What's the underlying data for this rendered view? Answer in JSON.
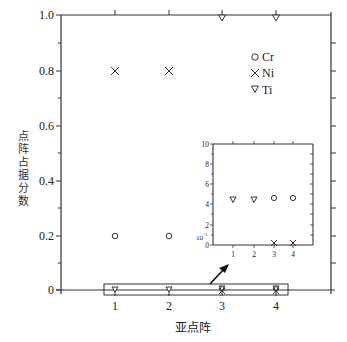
{
  "chart_data": [
    {
      "type": "scatter",
      "title": "",
      "xlabel": "亚点阵",
      "ylabel": "点阵占据分数",
      "x": [
        1,
        2,
        3,
        4
      ],
      "x_ticks": [
        "1",
        "2",
        "3",
        "4"
      ],
      "y_ticks": [
        "0",
        "0.2",
        "0.4",
        "0.6",
        "0.8",
        "1.0"
      ],
      "ylim": [
        0,
        1.0
      ],
      "grid": false,
      "legend_position": "upper right",
      "series": [
        {
          "name": "Cr",
          "marker": "circle",
          "values": [
            0.2,
            0.2,
            0.005,
            0.005
          ]
        },
        {
          "name": "Ni",
          "marker": "x",
          "values": [
            0.8,
            0.8,
            0.0,
            0.0
          ]
        },
        {
          "name": "Ti",
          "marker": "triangle-down",
          "values": [
            0.0,
            0.0,
            1.0,
            1.0
          ]
        }
      ],
      "annotations": [
        "Rectangle highlighting y≈0 region with arrow pointing to inset"
      ]
    },
    {
      "type": "scatter",
      "title": "Inset (zoom of y≈0 region)",
      "xlabel": "",
      "ylabel": "",
      "x": [
        1,
        2,
        3,
        4
      ],
      "x_ticks": [
        "1",
        "2",
        "3",
        "4"
      ],
      "y_ticks": [
        "0",
        "2",
        "4",
        "6",
        "8",
        "10"
      ],
      "y_scale_label": "10⁻³",
      "ylim": [
        0,
        10
      ],
      "series": [
        {
          "name": "Cr",
          "marker": "circle",
          "values": [
            null,
            null,
            4.7,
            4.7
          ]
        },
        {
          "name": "Ni",
          "marker": "x",
          "values": [
            null,
            null,
            0.1,
            0.1
          ]
        },
        {
          "name": "Ti",
          "marker": "triangle-down",
          "values": [
            4.6,
            4.6,
            null,
            null
          ]
        }
      ]
    }
  ],
  "main": {
    "xlabel": "亚点阵",
    "ylabel": "点阵占据分数",
    "yticks": [
      "1.0",
      "0.8",
      "0.6",
      "0.4",
      "0.2",
      "0"
    ],
    "xticks": [
      "1",
      "2",
      "3",
      "4"
    ],
    "legend": [
      {
        "label": "Cr",
        "marker": "○"
      },
      {
        "label": "Ni",
        "marker": "×"
      },
      {
        "label": "Ti",
        "marker": "▽"
      }
    ]
  },
  "inset": {
    "yticks": [
      "10",
      "8",
      "6",
      "4",
      "2",
      "0"
    ],
    "scale": "10",
    "scale_exp": "-3",
    "xticks": [
      "1",
      "2",
      "3",
      "4"
    ]
  },
  "colors": {
    "axis": "#333333",
    "marker": "#333333",
    "background": "#ffffff"
  }
}
